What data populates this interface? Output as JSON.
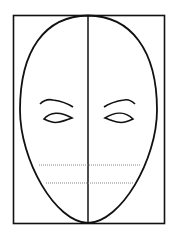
{
  "diagram": {
    "title": "",
    "elements": [
      {
        "id": "frame",
        "type": "rectangle"
      },
      {
        "id": "head-outline",
        "type": "egg-shape"
      },
      {
        "id": "center-line",
        "type": "vertical-line"
      },
      {
        "id": "left-eyebrow",
        "type": "curve"
      },
      {
        "id": "right-eyebrow",
        "type": "curve"
      },
      {
        "id": "left-eye",
        "type": "almond"
      },
      {
        "id": "right-eye",
        "type": "almond"
      },
      {
        "id": "guide-line-nose",
        "type": "dotted-line"
      },
      {
        "id": "guide-line-mouth",
        "type": "dotted-line"
      }
    ],
    "colors": {
      "stroke": "#111111",
      "guide": "#888888",
      "background": "#ffffff"
    }
  }
}
